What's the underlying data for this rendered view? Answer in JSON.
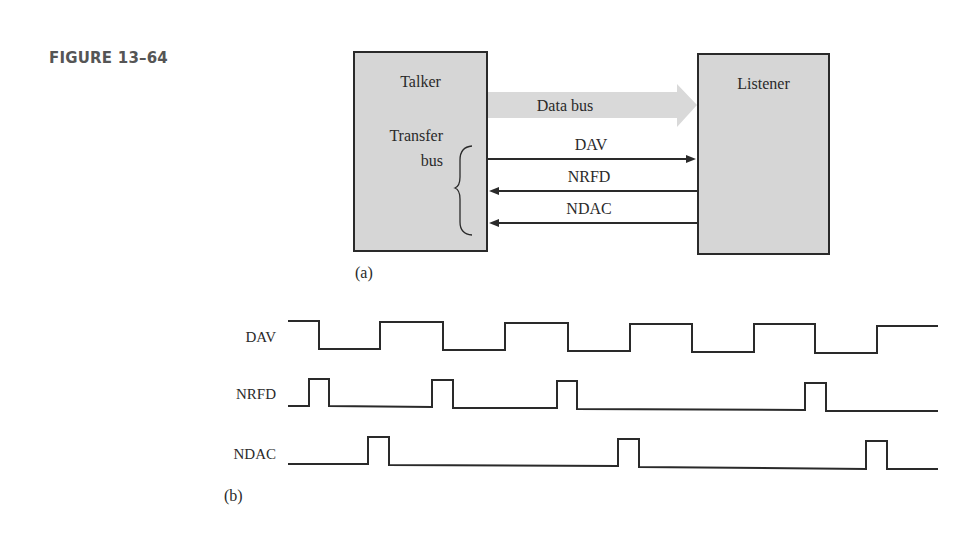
{
  "figure": {
    "title": "FIGURE 13–64"
  },
  "part_a": {
    "label": "(a)",
    "talker": {
      "label": "Talker"
    },
    "listener": {
      "label": "Listener"
    },
    "transfer_bus": {
      "line1": "Transfer",
      "line2": "bus"
    },
    "data_bus": {
      "label": "Data bus",
      "direction": "talker-to-listener"
    },
    "lines": [
      {
        "name": "DAV",
        "direction": "talker-to-listener"
      },
      {
        "name": "NRFD",
        "direction": "listener-to-talker"
      },
      {
        "name": "NDAC",
        "direction": "listener-to-talker"
      }
    ]
  },
  "part_b": {
    "label": "(b)",
    "signals": [
      {
        "name": "DAV",
        "initial": "high",
        "transitions": [
          319,
          380,
          443,
          505,
          568,
          630,
          692,
          754,
          815,
          877
        ]
      },
      {
        "name": "NRFD",
        "initial": "low",
        "pulses": [
          [
            309,
            329
          ],
          [
            432,
            453
          ],
          [
            557,
            577
          ],
          [
            805,
            826
          ]
        ]
      },
      {
        "name": "NDAC",
        "initial": "low",
        "pulses": [
          [
            368,
            389
          ],
          [
            618,
            639
          ],
          [
            866,
            887
          ]
        ]
      }
    ]
  },
  "colors": {
    "block_fill": "#d6d6d6",
    "data_bus_fill": "#d9d9d9",
    "line": "#2a2a2a",
    "title": "#555555"
  }
}
